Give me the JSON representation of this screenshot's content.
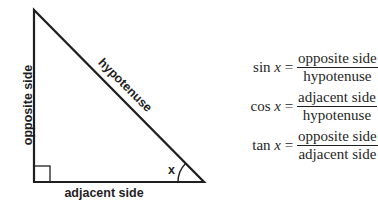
{
  "diagram": {
    "type": "right-triangle",
    "vertices": {
      "top": [
        34,
        10
      ],
      "right_angle": [
        34,
        182
      ],
      "angle_x": [
        204,
        182
      ]
    },
    "stroke_color": "#1f1f1f",
    "labels": {
      "opposite": "opposite side",
      "hypotenuse": "hypotenuse",
      "adjacent": "adjacent side",
      "angle": "x"
    },
    "right_angle_marker": "square"
  },
  "formulas": [
    {
      "func": "sin",
      "var": "x",
      "equals": "=",
      "numerator": "opposite side",
      "denominator": "hypotenuse"
    },
    {
      "func": "cos",
      "var": "x",
      "equals": "=",
      "numerator": "adjacent side",
      "denominator": "hypotenuse"
    },
    {
      "func": "tan",
      "var": "x",
      "equals": "=",
      "numerator": "opposite side",
      "denominator": "adjacent side"
    }
  ]
}
